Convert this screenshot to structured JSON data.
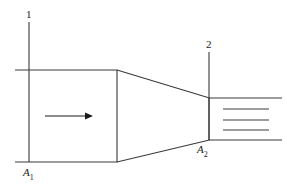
{
  "figure": {
    "stroke_color": "#3a3a3a",
    "text_color": "#1a1a1a",
    "background_color": "#ffffff",
    "labels": {
      "station_1": "1",
      "station_2": "2",
      "area_1_symbol": "A",
      "area_1_subscript": "1",
      "area_2_symbol": "A",
      "area_2_subscript": "2"
    },
    "geometry": {
      "inlet_top_y": 70,
      "inlet_bottom_y": 162,
      "throat_x": 117,
      "exit_x": 209,
      "exit_top_y": 98,
      "exit_bottom_y": 140,
      "station_1_x": 29,
      "station_2_x": 209,
      "arrow_start_x": 45,
      "arrow_end_x": 93,
      "arrow_y": 116,
      "jet_right_x": 282,
      "jet_inner_right_x": 269,
      "jet_inner_left_x": 223,
      "jet_line_y_values": [
        98,
        109,
        120,
        130,
        140
      ]
    }
  }
}
